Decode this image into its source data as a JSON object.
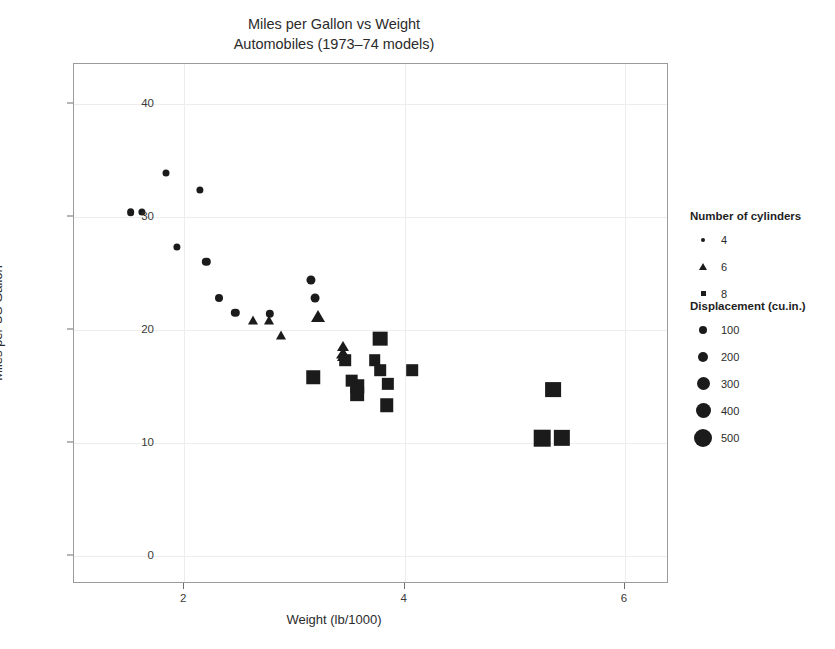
{
  "title": {
    "main": "Miles per Gallon vs Weight",
    "sub": "Automobiles (1973–74 models)"
  },
  "axes": {
    "xlabel": "Weight (lb/1000)",
    "ylabel": "Miles per US Gallon",
    "xticks": [
      "2",
      "4",
      "6"
    ],
    "yticks": [
      "0",
      "10",
      "20",
      "30",
      "40"
    ]
  },
  "legends": {
    "shape": {
      "title": "Number of cylinders",
      "items": [
        {
          "label": "4",
          "glyph": "circle-glyph"
        },
        {
          "label": "6",
          "glyph": "triangle-glyph"
        },
        {
          "label": "8",
          "glyph": "square-glyph"
        }
      ]
    },
    "size": {
      "title": "Displacement (cu.in.)",
      "items": [
        {
          "label": "100",
          "px": 8
        },
        {
          "label": "200",
          "px": 10
        },
        {
          "label": "300",
          "px": 13
        },
        {
          "label": "400",
          "px": 15
        },
        {
          "label": "500",
          "px": 18
        }
      ]
    }
  },
  "chart_data": {
    "type": "scatter",
    "title": "Miles per Gallon vs Weight",
    "subtitle": "Automobiles (1973–74 models)",
    "xlabel": "Weight (lb/1000)",
    "ylabel": "Miles per US Gallon",
    "xlim": [
      1.0,
      6.4
    ],
    "ylim": [
      -2.5,
      43.5
    ],
    "xticks": [
      2,
      4,
      6
    ],
    "yticks": [
      0,
      10,
      20,
      30,
      40
    ],
    "grid": true,
    "legend_position": "right",
    "encodings": {
      "x": "wt",
      "y": "mpg",
      "shape": "cyl",
      "size": "disp",
      "color": "#1b1b1b"
    },
    "points": [
      {
        "x": 1.513,
        "y": 30.4,
        "cyl": 4,
        "disp": 95.1
      },
      {
        "x": 1.615,
        "y": 30.4,
        "cyl": 4,
        "disp": 75.7
      },
      {
        "x": 1.835,
        "y": 33.9,
        "cyl": 4,
        "disp": 71.1
      },
      {
        "x": 1.935,
        "y": 27.3,
        "cyl": 4,
        "disp": 79.0
      },
      {
        "x": 2.14,
        "y": 32.4,
        "cyl": 4,
        "disp": 78.7
      },
      {
        "x": 2.2,
        "y": 26.0,
        "cyl": 4,
        "disp": 120.3
      },
      {
        "x": 2.32,
        "y": 22.8,
        "cyl": 4,
        "disp": 108.0
      },
      {
        "x": 2.465,
        "y": 21.5,
        "cyl": 4,
        "disp": 120.1
      },
      {
        "x": 2.62,
        "y": 21.0,
        "cyl": 6,
        "disp": 160.0
      },
      {
        "x": 2.77,
        "y": 21.0,
        "cyl": 6,
        "disp": 160.0
      },
      {
        "x": 2.78,
        "y": 21.4,
        "cyl": 4,
        "disp": 121.0
      },
      {
        "x": 2.875,
        "y": 19.7,
        "cyl": 6,
        "disp": 145.0
      },
      {
        "x": 3.15,
        "y": 24.4,
        "cyl": 4,
        "disp": 146.7
      },
      {
        "x": 3.19,
        "y": 22.8,
        "cyl": 4,
        "disp": 140.8
      },
      {
        "x": 3.215,
        "y": 21.4,
        "cyl": 6,
        "disp": 258.0
      },
      {
        "x": 3.44,
        "y": 18.7,
        "cyl": 6,
        "disp": 167.6
      },
      {
        "x": 3.44,
        "y": 18.1,
        "cyl": 6,
        "disp": 225.0
      },
      {
        "x": 3.44,
        "y": 17.8,
        "cyl": 6,
        "disp": 167.6
      },
      {
        "x": 3.46,
        "y": 17.3,
        "cyl": 8,
        "disp": 275.8
      },
      {
        "x": 3.52,
        "y": 15.5,
        "cyl": 8,
        "disp": 318.0
      },
      {
        "x": 3.57,
        "y": 15.0,
        "cyl": 8,
        "disp": 350.0
      },
      {
        "x": 3.57,
        "y": 14.3,
        "cyl": 8,
        "disp": 360.0
      },
      {
        "x": 3.73,
        "y": 17.3,
        "cyl": 8,
        "disp": 275.8
      },
      {
        "x": 3.78,
        "y": 16.4,
        "cyl": 8,
        "disp": 275.8
      },
      {
        "x": 3.78,
        "y": 19.2,
        "cyl": 8,
        "disp": 400.0
      },
      {
        "x": 3.84,
        "y": 13.3,
        "cyl": 8,
        "disp": 350.0
      },
      {
        "x": 3.845,
        "y": 15.2,
        "cyl": 8,
        "disp": 304.0
      },
      {
        "x": 3.17,
        "y": 15.8,
        "cyl": 8,
        "disp": 351.0
      },
      {
        "x": 4.07,
        "y": 16.4,
        "cyl": 8,
        "disp": 275.8
      },
      {
        "x": 5.25,
        "y": 10.4,
        "cyl": 8,
        "disp": 472.0
      },
      {
        "x": 5.345,
        "y": 14.7,
        "cyl": 8,
        "disp": 440.0
      },
      {
        "x": 5.424,
        "y": 10.4,
        "cyl": 8,
        "disp": 460.0
      }
    ]
  }
}
